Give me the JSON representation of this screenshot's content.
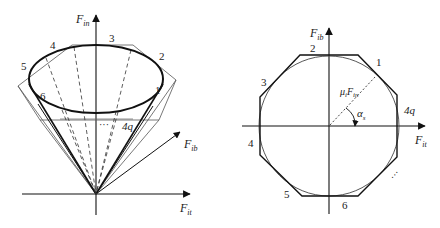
{
  "left_figure": {
    "axes": {
      "vertical": {
        "symbol": "F",
        "subscript": "in"
      },
      "horizontal": {
        "symbol": "F",
        "subscript": "it"
      },
      "oblique": {
        "symbol": "F",
        "subscript": "ib"
      }
    },
    "facet_labels": [
      "1",
      "2",
      "3",
      "4",
      "5",
      "6",
      "4q"
    ],
    "ellipsis": "···"
  },
  "right_figure": {
    "axes": {
      "vertical": {
        "symbol": "F",
        "subscript": "ib"
      },
      "horizontal": {
        "symbol": "F",
        "subscript": "it"
      }
    },
    "facet_labels": [
      "1",
      "2",
      "3",
      "4",
      "5",
      "6",
      "4q"
    ],
    "radius_label": {
      "prefix": "μ",
      "prefix_sub": "i",
      "symbol": "F",
      "subscript": "in"
    },
    "angle_label": {
      "symbol": "α",
      "subscript": "s"
    },
    "ellipsis": "···"
  },
  "colors": {
    "stroke": "#1a1a1a",
    "thin_stroke": "#555555",
    "background": "#ffffff"
  }
}
